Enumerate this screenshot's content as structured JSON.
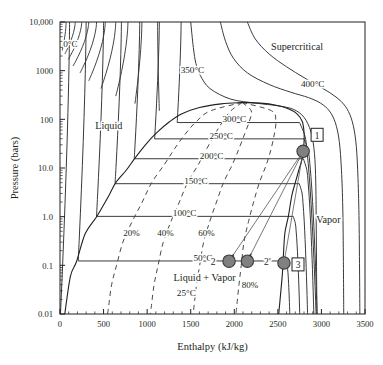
{
  "figure": {
    "kind": "pressure-enthalpy-diagram",
    "substance_implied": "water-steam",
    "colors": {
      "background": "#ffffff",
      "axis": "#231f20",
      "isotherm": "#3a3a3a",
      "quality_line": "#4a4a4a",
      "marker_fill": "#808080",
      "marker_stroke": "#3c3c3c",
      "text": "#231f20"
    }
  },
  "axes": {
    "x": {
      "label": "Enthalpy (kJ/kg)",
      "ticks": [
        0,
        500,
        1000,
        1500,
        2000,
        2500,
        3000,
        3500
      ],
      "tick_labels": [
        "0",
        "500",
        "1000",
        "1500",
        "2000",
        "2500",
        "3000",
        "3500"
      ],
      "min": 0,
      "max": 3500,
      "minor_tick_step": 100,
      "scale": "linear"
    },
    "y": {
      "label": "Pressure (bars)",
      "ticks": [
        0.01,
        0.1,
        1.0,
        10.0,
        100,
        1000,
        10000
      ],
      "tick_labels": [
        "0.01",
        "0.1",
        "1.0",
        "10.0",
        "100",
        "1000",
        "10,000"
      ],
      "min": 0.01,
      "max": 10000,
      "scale": "log"
    }
  },
  "region_labels": [
    {
      "text": "Supercritical",
      "h": 2720,
      "p": 2600
    },
    {
      "text": "Liquid",
      "h": 560,
      "p": 62
    },
    {
      "text": "Vapor",
      "h": 3080,
      "p": 0.75
    },
    {
      "text": "Liquid + Vapor",
      "h": 1660,
      "p": 0.048
    }
  ],
  "isotherm_labels": [
    {
      "text": "0°C",
      "h": 120,
      "p": 3000
    },
    {
      "text": "350°C",
      "h": 1520,
      "p": 880
    },
    {
      "text": "400°C",
      "h": 2900,
      "p": 470
    },
    {
      "text": "300°C",
      "h": 2000,
      "p": 88
    },
    {
      "text": "250°C",
      "h": 1850,
      "p": 39
    },
    {
      "text": "200°C",
      "h": 1740,
      "p": 15.5
    },
    {
      "text": "150°C",
      "h": 1560,
      "p": 4.8
    },
    {
      "text": "100°C",
      "h": 1430,
      "p": 1.01
    },
    {
      "text": "50°C",
      "h": 1640,
      "p": 0.123
    },
    {
      "text": "25°C",
      "h": 1450,
      "p": 0.0235
    }
  ],
  "quality_labels": [
    {
      "text": "20%",
      "h": 820,
      "p": 0.4
    },
    {
      "text": "40%",
      "h": 1210,
      "p": 0.4
    },
    {
      "text": "60%",
      "h": 1680,
      "p": 0.4
    },
    {
      "text": "80%",
      "h": 2180,
      "p": 0.035
    }
  ],
  "state_points": [
    {
      "id": "1",
      "label": "1",
      "boxed": true,
      "h": 2790,
      "p": 22.0,
      "marker": true
    },
    {
      "id": "2",
      "label": "2",
      "boxed": false,
      "h": 1940,
      "p": 0.122,
      "marker": true
    },
    {
      "id": "2p",
      "label": "2'",
      "boxed": false,
      "h": 2150,
      "p": 0.122,
      "marker": true
    },
    {
      "id": "3",
      "label": "3",
      "boxed": true,
      "h": 2570,
      "p": 0.112,
      "marker": true
    }
  ],
  "chart_data": {
    "type": "line",
    "title": "",
    "xlabel": "Enthalpy (kJ/kg)",
    "ylabel": "Pressure (bars)",
    "xlim": [
      0,
      3500
    ],
    "ylim": [
      0.01,
      10000
    ],
    "yscale": "log",
    "grid": false,
    "legend": "none",
    "series": [
      {
        "name": "saturated-liquid-line",
        "kind": "dome-left",
        "points_hp": [
          [
            55,
            0.01
          ],
          [
            120,
            0.06
          ],
          [
            190,
            0.12
          ],
          [
            290,
            0.45
          ],
          [
            420,
            1.0
          ],
          [
            560,
            2.7
          ],
          [
            640,
            5.0
          ],
          [
            760,
            9.0
          ],
          [
            860,
            16
          ],
          [
            1000,
            33
          ],
          [
            1120,
            55
          ],
          [
            1260,
            90
          ],
          [
            1400,
            130
          ],
          [
            1600,
            175
          ],
          [
            1850,
            208
          ],
          [
            2090,
            221
          ]
        ]
      },
      {
        "name": "saturated-vapor-line",
        "kind": "dome-right",
        "points_hp": [
          [
            2090,
            221
          ],
          [
            2300,
            215
          ],
          [
            2480,
            195
          ],
          [
            2620,
            165
          ],
          [
            2720,
            130
          ],
          [
            2780,
            90
          ],
          [
            2800,
            55
          ],
          [
            2800,
            33
          ],
          [
            2780,
            16
          ],
          [
            2740,
            9.0
          ],
          [
            2700,
            5.0
          ],
          [
            2660,
            2.7
          ],
          [
            2620,
            1.0
          ],
          [
            2580,
            0.45
          ],
          [
            2560,
            0.12
          ],
          [
            2550,
            0.06
          ],
          [
            2510,
            0.01
          ]
        ]
      },
      {
        "name": "isotherm-0C",
        "temperature_C": 0,
        "style": "solid"
      },
      {
        "name": "isotherm-50C",
        "temperature_C": 50,
        "style": "solid"
      },
      {
        "name": "isotherm-100C",
        "temperature_C": 100,
        "style": "solid"
      },
      {
        "name": "isotherm-150C",
        "temperature_C": 150,
        "style": "solid"
      },
      {
        "name": "isotherm-200C",
        "temperature_C": 200,
        "style": "solid"
      },
      {
        "name": "isotherm-250C",
        "temperature_C": 250,
        "style": "solid"
      },
      {
        "name": "isotherm-300C",
        "temperature_C": 300,
        "style": "solid"
      },
      {
        "name": "isotherm-350C",
        "temperature_C": 350,
        "style": "solid"
      },
      {
        "name": "isotherm-400C",
        "temperature_C": 400,
        "style": "solid"
      },
      {
        "name": "quality-20pct",
        "quality": 0.2,
        "style": "dashed"
      },
      {
        "name": "quality-40pct",
        "quality": 0.4,
        "style": "dashed"
      },
      {
        "name": "quality-60pct",
        "quality": 0.6,
        "style": "dashed"
      },
      {
        "name": "quality-80pct",
        "quality": 0.8,
        "style": "dashed"
      }
    ],
    "annotations": [
      {
        "text": "Supercritical"
      },
      {
        "text": "Liquid"
      },
      {
        "text": "Vapor"
      },
      {
        "text": "Liquid + Vapor"
      },
      {
        "text": "1"
      },
      {
        "text": "2"
      },
      {
        "text": "2'"
      },
      {
        "text": "3"
      }
    ]
  }
}
